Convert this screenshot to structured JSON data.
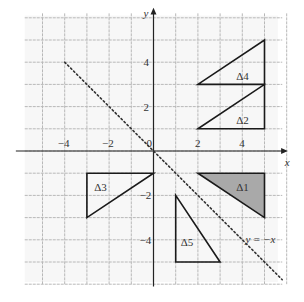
{
  "diagram": {
    "type": "coordinate-grid",
    "x_range": [
      -6,
      6
    ],
    "y_range": [
      -6,
      6
    ],
    "grid_step": 1,
    "axis_labels": {
      "x": "x",
      "y": "y"
    },
    "origin_label": "0",
    "x_ticks": [
      {
        "value": -4,
        "label": "−4"
      },
      {
        "value": -2,
        "label": "−2"
      },
      {
        "value": 2,
        "label": "2"
      },
      {
        "value": 4,
        "label": "4"
      }
    ],
    "y_ticks": [
      {
        "value": 4,
        "label": "4"
      },
      {
        "value": 2,
        "label": "2"
      },
      {
        "value": -2,
        "label": "−2"
      },
      {
        "value": -4,
        "label": "−4"
      }
    ],
    "line": {
      "equation_label": "y = −x",
      "style": "dotted",
      "from": [
        -4,
        4
      ],
      "to": [
        5.8,
        -5.8
      ]
    },
    "triangles": [
      {
        "name": "Δ1",
        "vertices": [
          [
            2,
            -1
          ],
          [
            5,
            -1
          ],
          [
            5,
            -3
          ]
        ],
        "shaded": true,
        "label_pos": [
          4,
          -1.6
        ]
      },
      {
        "name": "Δ2",
        "vertices": [
          [
            2,
            1
          ],
          [
            5,
            1
          ],
          [
            5,
            3
          ]
        ],
        "shaded": false,
        "label_pos": [
          4,
          1.4
        ]
      },
      {
        "name": "Δ3",
        "vertices": [
          [
            -3,
            -1
          ],
          [
            0,
            -1
          ],
          [
            -3,
            -3
          ]
        ],
        "shaded": false,
        "label_pos": [
          -2.4,
          -1.6
        ]
      },
      {
        "name": "Δ4",
        "vertices": [
          [
            2,
            3
          ],
          [
            5,
            3
          ],
          [
            5,
            5
          ]
        ],
        "shaded": false,
        "label_pos": [
          4,
          3.4
        ]
      },
      {
        "name": "Δ5",
        "vertices": [
          [
            1,
            -2
          ],
          [
            1,
            -5
          ],
          [
            3,
            -5
          ]
        ],
        "shaded": false,
        "label_pos": [
          1.5,
          -4.1
        ]
      }
    ],
    "colors": {
      "grid": "#b8b8b8",
      "axis": "#222222",
      "triangle_stroke": "#1a1a1a",
      "shade": "#a9a9a9",
      "dotted": "#333333"
    }
  }
}
